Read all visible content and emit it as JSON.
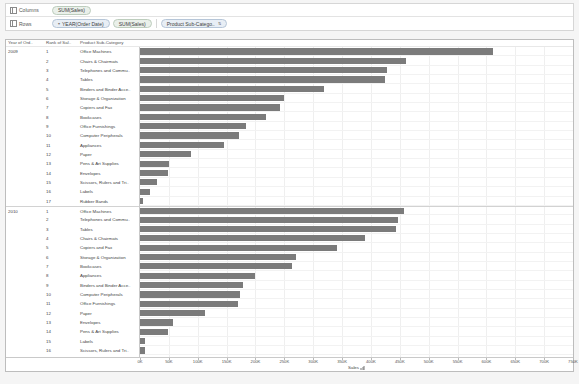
{
  "shelves": {
    "columns": {
      "label": "Columns",
      "icon": "grid-columns-icon",
      "pills": [
        {
          "text": "SUM(Sales)",
          "type": "green"
        }
      ]
    },
    "rows": {
      "label": "Rows",
      "icon": "grid-rows-icon",
      "pills": [
        {
          "text": "YEAR(Order Date)",
          "type": "blue",
          "caret": "▾"
        },
        {
          "text": "SUM(Sales)",
          "type": "green"
        },
        {
          "text": "Product Sub-Catego..",
          "type": "blue",
          "sort": "⇅"
        }
      ]
    }
  },
  "headers": {
    "year": "Year of Ord..",
    "rank": "Rank of Sal..",
    "subcategory": "Product Sub-Category"
  },
  "axis": {
    "title": "Sales",
    "sort_icon": "sort-descending-icon",
    "tick_labels": [
      "0K",
      "50K",
      "100K",
      "150K",
      "200K",
      "250K",
      "300K",
      "350K",
      "400K",
      "450K",
      "500K",
      "550K",
      "600K",
      "650K",
      "700K",
      "750K"
    ],
    "min": 0,
    "max": 750000
  },
  "chart_data": {
    "type": "bar",
    "xlabel": "Sales",
    "ylabel": "Product Sub-Category",
    "xlim": [
      0,
      750000
    ],
    "grid": true,
    "orientation": "horizontal",
    "bar_color": "#7b7b7b",
    "groups": [
      {
        "year": "2009",
        "rows": [
          {
            "rank": "1",
            "label": "Office Machines",
            "value": 612000
          },
          {
            "rank": "2",
            "label": "Chairs & Chairmats",
            "value": 461000
          },
          {
            "rank": "3",
            "label": "Telephones and Commu..",
            "value": 427000
          },
          {
            "rank": "4",
            "label": "Tables",
            "value": 425000
          },
          {
            "rank": "5",
            "label": "Binders and Binder Acce..",
            "value": 319000
          },
          {
            "rank": "6",
            "label": "Storage & Organization",
            "value": 250000
          },
          {
            "rank": "7",
            "label": "Copiers and Fax",
            "value": 242000
          },
          {
            "rank": "8",
            "label": "Bookcases",
            "value": 218000
          },
          {
            "rank": "9",
            "label": "Office Furnishings",
            "value": 183000
          },
          {
            "rank": "10",
            "label": "Computer Peripherals",
            "value": 172000
          },
          {
            "rank": "11",
            "label": "Appliances",
            "value": 145000
          },
          {
            "rank": "12",
            "label": "Paper",
            "value": 89000
          },
          {
            "rank": "13",
            "label": "Pens & Art Supplies",
            "value": 51000
          },
          {
            "rank": "14",
            "label": "Envelopes",
            "value": 48000
          },
          {
            "rank": "15",
            "label": "Scissors, Rulers and Tri..",
            "value": 30000
          },
          {
            "rank": "16",
            "label": "Labels",
            "value": 17000
          },
          {
            "rank": "17",
            "label": "Rubber Bands",
            "value": 6000
          }
        ]
      },
      {
        "year": "2010",
        "rows": [
          {
            "rank": "1",
            "label": "Office Machines",
            "value": 458000
          },
          {
            "rank": "2",
            "label": "Telephones and Commu..",
            "value": 447000
          },
          {
            "rank": "3",
            "label": "Tables",
            "value": 443000
          },
          {
            "rank": "4",
            "label": "Chairs & Chairmats",
            "value": 389000
          },
          {
            "rank": "5",
            "label": "Copiers and Fax",
            "value": 341000
          },
          {
            "rank": "6",
            "label": "Storage & Organization",
            "value": 270000
          },
          {
            "rank": "7",
            "label": "Bookcases",
            "value": 263000
          },
          {
            "rank": "8",
            "label": "Appliances",
            "value": 199000
          },
          {
            "rank": "9",
            "label": "Binders and Binder Acce..",
            "value": 178000
          },
          {
            "rank": "10",
            "label": "Computer Peripherals",
            "value": 174000
          },
          {
            "rank": "11",
            "label": "Office Furnishings",
            "value": 170000
          },
          {
            "rank": "12",
            "label": "Paper",
            "value": 112000
          },
          {
            "rank": "13",
            "label": "Envelopes",
            "value": 57000
          },
          {
            "rank": "14",
            "label": "Pens & Art Supplies",
            "value": 48000
          },
          {
            "rank": "15",
            "label": "Labels",
            "value": 9000
          },
          {
            "rank": "16",
            "label": "Scissors, Rulers and Tri..",
            "value": 8000
          },
          {
            "rank": "17",
            "label": "Rubber Bands",
            "value": 5000
          }
        ]
      },
      {
        "year": "2011",
        "rows": [
          {
            "rank": "1",
            "label": "Tables",
            "value": 526000
          },
          {
            "rank": "2",
            "label": "Telephones and Commu..",
            "value": 490000
          },
          {
            "rank": "3",
            "label": "Chairs & Chairmats",
            "value": 475000
          }
        ]
      }
    ]
  }
}
